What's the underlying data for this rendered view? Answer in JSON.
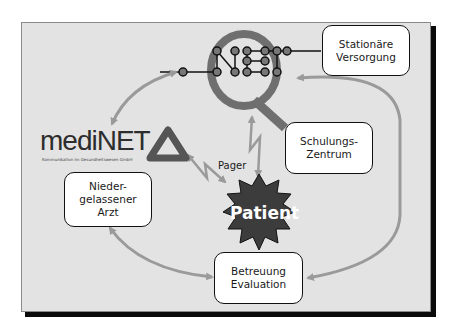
{
  "diagram": {
    "nodes": {
      "stationaer": {
        "label": "Stationäre\nVersorgung"
      },
      "schulung": {
        "label": "Schulungs-\nZentrum"
      },
      "arzt": {
        "label": "Nieder-\ngelassener\nArzt"
      },
      "betreuung": {
        "label": "Betreuung\nEvaluation"
      },
      "patient": {
        "label": "Patient"
      }
    },
    "pager_label": "Pager",
    "logos": {
      "medinet": {
        "wordmark": "mediNET",
        "subtitle": "Kommunikation im Gesundheitswesen GmbH",
        "icon": "triangle-logo-icon"
      },
      "qnet": {
        "letter": "Q",
        "text": "NET",
        "icon": "network-dots-icon"
      }
    },
    "edges": [
      {
        "from": "medinet",
        "to": "qnet",
        "style": "bidirectional-arrow"
      },
      {
        "from": "qnet",
        "to": "patient",
        "style": "lightning-bidirectional",
        "label": ""
      },
      {
        "from": "medinet",
        "to": "patient",
        "style": "lightning-bidirectional",
        "label": "Pager"
      },
      {
        "from": "arzt",
        "to": "betreuung",
        "style": "bidirectional-arrow"
      },
      {
        "from": "stationaer",
        "to": "betreuung",
        "style": "bidirectional-arrow"
      }
    ],
    "colors": {
      "background": "#e3e3e3",
      "arrow": "#9a9a9a",
      "q_letter": "#6f6f6f",
      "patient_star": "#3c3c3c",
      "frame_shadow": "#0a0a0a"
    }
  }
}
